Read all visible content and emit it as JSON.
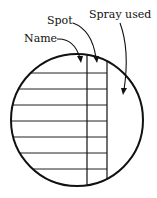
{
  "diagram": {
    "labels": {
      "name": "Name",
      "spot": "Spot",
      "spray_used": "Spray used"
    },
    "circle": {
      "cx": 77,
      "cy": 120,
      "r": 66
    },
    "columns_x": [
      87,
      107
    ],
    "rows_y": [
      73,
      89,
      105,
      121,
      137,
      153,
      169
    ],
    "colors": {
      "stroke": "#111111",
      "background": "#ffffff"
    }
  }
}
